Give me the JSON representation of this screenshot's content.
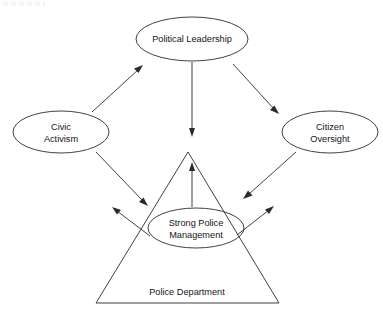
{
  "diagram": {
    "type": "relationship-diagram",
    "background_color": "#ffffff",
    "stroke_color": "#2b2b2b",
    "text_color": "#141414",
    "container": {
      "shape": "triangle",
      "label": "Police Department",
      "label_x": 187,
      "label_y": 292,
      "apex": {
        "x": 188,
        "y": 152
      },
      "base_left": {
        "x": 96,
        "y": 303
      },
      "base_right": {
        "x": 279,
        "y": 303
      }
    },
    "nodes": [
      {
        "id": "political-leadership",
        "label": "Political Leadership",
        "lines": [
          "Political Leadership"
        ],
        "shape": "ellipse",
        "cx": 192,
        "cy": 39,
        "rx": 56,
        "ry": 22
      },
      {
        "id": "civic-activism",
        "label": "Civic Activism",
        "lines": [
          "Civic",
          "Activism"
        ],
        "shape": "ellipse",
        "cx": 61,
        "cy": 132,
        "rx": 48,
        "ry": 21
      },
      {
        "id": "citizen-oversight",
        "label": "Citizen Oversight",
        "lines": [
          "Citizen",
          "Oversight"
        ],
        "shape": "ellipse",
        "cx": 330,
        "cy": 132,
        "rx": 48,
        "ry": 21
      },
      {
        "id": "strong-police-management",
        "label": "Strong Police Management",
        "lines": [
          "Strong Police",
          "Management"
        ],
        "shape": "ellipse",
        "cx": 196,
        "cy": 228,
        "rx": 48,
        "ry": 20
      }
    ],
    "connectors": [
      {
        "id": "civic-to-political",
        "from": "civic-activism",
        "to": "political-leadership",
        "direction": "one-way",
        "x1": 92,
        "y1": 112,
        "x2": 142,
        "y2": 66
      },
      {
        "id": "political-to-management",
        "from": "political-leadership",
        "to": "strong-police-management",
        "direction": "one-way",
        "x1": 192,
        "y1": 62,
        "x2": 192,
        "y2": 136
      },
      {
        "id": "political-to-citizen",
        "from": "political-leadership",
        "to": "citizen-oversight",
        "direction": "one-way",
        "x1": 233,
        "y1": 64,
        "x2": 278,
        "y2": 113
      },
      {
        "id": "civic-to-management",
        "from": "civic-activism",
        "to": "strong-police-management",
        "direction": "one-way",
        "x1": 96,
        "y1": 152,
        "x2": 147,
        "y2": 205
      },
      {
        "id": "citizen-to-management",
        "from": "citizen-oversight",
        "to": "strong-police-management",
        "direction": "one-way",
        "x1": 296,
        "y1": 152,
        "x2": 244,
        "y2": 198
      },
      {
        "id": "management-to-police-department",
        "from": "strong-police-management",
        "to": "police-department-apex",
        "direction": "one-way",
        "x1": 192,
        "y1": 207,
        "x2": 192,
        "y2": 163
      },
      {
        "id": "management-out-left",
        "from": "strong-police-management",
        "to": "civic-activism",
        "direction": "one-way",
        "x1": 150,
        "y1": 236,
        "x2": 113,
        "y2": 208
      },
      {
        "id": "management-out-right",
        "from": "strong-police-management",
        "to": "citizen-oversight",
        "direction": "one-way",
        "x1": 237,
        "y1": 235,
        "x2": 273,
        "y2": 207
      }
    ]
  }
}
